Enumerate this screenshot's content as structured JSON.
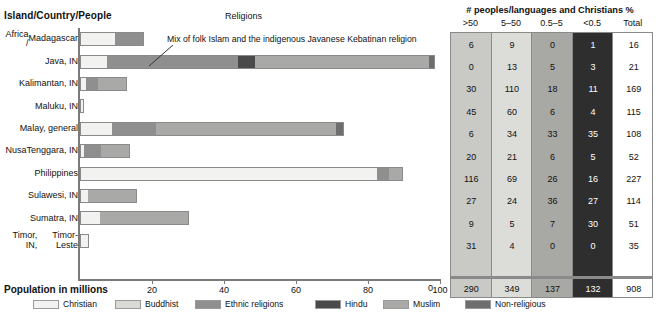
{
  "header": {
    "left_title": "Island/Country/People",
    "chart_title": "Religions",
    "table_title": "# peoples/languages and Christians %"
  },
  "annotation": "Mix of folk Islam and the indigenous Javanese Kebatinan religion",
  "axis": {
    "label": "Population in millions",
    "ticks": [
      "20",
      "40",
      "60",
      "80",
      "100"
    ],
    "min": 0,
    "max": 100
  },
  "legend": [
    {
      "label": "Christian",
      "color": "#f2f2f0"
    },
    {
      "label": "Buddhist",
      "color": "#d9d9d6"
    },
    {
      "label": "Ethnic religions",
      "color": "#8f8f8f"
    },
    {
      "label": "Hindu",
      "color": "#4a4a4a"
    },
    {
      "label": "Muslim",
      "color": "#a9a9a7"
    },
    {
      "label": "Non-religious",
      "color": "#6e6e6e"
    }
  ],
  "table": {
    "columns": [
      ">50",
      "5–50",
      "0.5–5",
      "<0.5",
      "Total"
    ],
    "rows": [
      [
        "6",
        "9",
        "0",
        "1",
        "16"
      ],
      [
        "0",
        "13",
        "5",
        "3",
        "21"
      ],
      [
        "30",
        "110",
        "18",
        "11",
        "169"
      ],
      [
        "45",
        "60",
        "6",
        "4",
        "115"
      ],
      [
        "6",
        "34",
        "33",
        "35",
        "108"
      ],
      [
        "20",
        "21",
        "6",
        "5",
        "52"
      ],
      [
        "116",
        "69",
        "26",
        "16",
        "227"
      ],
      [
        "27",
        "24",
        "36",
        "27",
        "114"
      ],
      [
        "9",
        "5",
        "7",
        "30",
        "51"
      ],
      [
        "31",
        "4",
        "0",
        "0",
        "35"
      ]
    ],
    "totals": [
      "290",
      "349",
      "137",
      "132",
      "908"
    ],
    "left_total": "0"
  },
  "chart_data": {
    "type": "bar",
    "orientation": "horizontal",
    "stacked": true,
    "title": "Religions",
    "xlabel": "Population in millions",
    "ylabel": "Island/Country/People",
    "xlim": [
      0,
      100
    ],
    "grid": false,
    "legend_position": "bottom",
    "categories": [
      "Africa / Madagascar",
      "Java, IN",
      "Kalimantan, IN",
      "Maluku, IN",
      "Malay, general",
      "Nusa Tenggara, IN",
      "Philippines",
      "Sulawesi, IN",
      "Sumatra, IN",
      "Timor, IN, Timor-Leste"
    ],
    "series": [
      {
        "name": "Christian",
        "color": "#f2f2f0",
        "values": [
          9.6,
          7.4,
          1.7,
          1.1,
          8.8,
          1.1,
          82.5,
          2.2,
          5.5,
          2.5
        ]
      },
      {
        "name": "Buddhist",
        "color": "#d9d9d6",
        "values": [
          0,
          0,
          0,
          0,
          0,
          0,
          0,
          0,
          0,
          0
        ]
      },
      {
        "name": "Ethnic religions",
        "color": "#8f8f8f",
        "values": [
          8.3,
          36.6,
          3.3,
          0,
          12.4,
          4.7,
          3.3,
          0,
          0,
          0
        ]
      },
      {
        "name": "Hindu",
        "color": "#4a4a4a",
        "values": [
          0,
          4.7,
          0,
          0,
          0,
          0,
          0,
          0,
          0,
          0
        ]
      },
      {
        "name": "Muslim",
        "color": "#a9a9a7",
        "values": [
          0,
          48.2,
          8.0,
          0,
          49.9,
          8.0,
          3.9,
          13.5,
          24.8,
          0
        ]
      },
      {
        "name": "Non-religious",
        "color": "#6e6e6e",
        "values": [
          0,
          1.7,
          0,
          0,
          2.2,
          0,
          0,
          0,
          0,
          0
        ]
      }
    ]
  },
  "rows": [
    {
      "label_lines": [
        "Africa /",
        "Madagascar"
      ]
    },
    {
      "label_lines": [
        "Java, IN"
      ]
    },
    {
      "label_lines": [
        "Kalimantan, IN"
      ]
    },
    {
      "label_lines": [
        "Maluku, IN"
      ]
    },
    {
      "label_lines": [
        "Malay, general"
      ]
    },
    {
      "label_lines": [
        "Nusa",
        "Tenggara, IN"
      ]
    },
    {
      "label_lines": [
        "Philippines"
      ]
    },
    {
      "label_lines": [
        "Sulawesi, IN"
      ]
    },
    {
      "label_lines": [
        "Sumatra, IN"
      ]
    },
    {
      "label_lines": [
        "Timor, IN,",
        "Timor-Leste"
      ]
    }
  ]
}
